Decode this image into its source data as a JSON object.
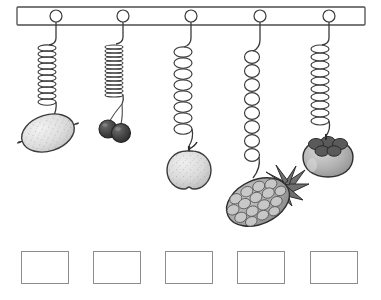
{
  "worksheet": {
    "title": "Springs with hanging fruits comparison worksheet",
    "background_color": "#ffffff",
    "width": 381,
    "height": 300
  },
  "support_bar": {
    "name": "horizontal-support-bar",
    "x": 17,
    "y": 7,
    "width": 348,
    "height": 18,
    "fill": "#ffffff",
    "stroke": "#4d4d4d",
    "stroke_width": 1.3
  },
  "hooks": [
    {
      "label": "hook-1",
      "cx": 56,
      "cy": 16,
      "r": 6
    },
    {
      "label": "hook-2",
      "cx": 123,
      "cy": 16,
      "r": 6
    },
    {
      "label": "hook-3",
      "cx": 191,
      "cy": 16,
      "r": 6
    },
    {
      "label": "hook-4",
      "cx": 260,
      "cy": 16,
      "r": 6
    },
    {
      "label": "hook-5",
      "cx": 329,
      "cy": 16,
      "r": 6
    }
  ],
  "springs": [
    {
      "id": "spring-1",
      "fruit": "lemon",
      "anchor_x": 56,
      "coil_top": 45,
      "coil_bottom": 104,
      "coils": 10,
      "coil_rx": 9,
      "coil_ry": 3.2,
      "stretch": "slightly-stretched",
      "hook_end_y": 118
    },
    {
      "id": "spring-2",
      "fruit": "cherries",
      "anchor_x": 123,
      "coil_top": 44,
      "coil_bottom": 95,
      "coils": 13,
      "coil_rx": 9,
      "coil_ry": 2.0,
      "stretch": "compressed",
      "hook_end_y": 104
    },
    {
      "id": "spring-3",
      "fruit": "apple",
      "anchor_x": 191,
      "coil_top": 46,
      "coil_bottom": 130,
      "coils": 8,
      "coil_rx": 9,
      "coil_ry": 5.2,
      "stretch": "stretched",
      "hook_end_y": 146
    },
    {
      "id": "spring-4",
      "fruit": "pineapple",
      "anchor_x": 260,
      "coil_top": 50,
      "coil_bottom": 162,
      "coils": 8,
      "coil_rx": 7.5,
      "coil_ry": 6.4,
      "stretch": "most-stretched",
      "hook_end_y": 180
    },
    {
      "id": "spring-5",
      "fruit": "persimmon",
      "anchor_x": 329,
      "coil_top": 45,
      "coil_bottom": 122,
      "coils": 10,
      "coil_rx": 9,
      "coil_ry": 4.0,
      "stretch": "moderately-stretched",
      "hook_end_y": 136
    }
  ],
  "fruits": [
    {
      "id": "fruit-lemon",
      "name": "lemon",
      "cx": 48,
      "cy": 133,
      "rx": 27,
      "ry": 18,
      "rotation": -18,
      "fill": "#e0e0e0",
      "stroke": "#3a3a3a",
      "texture": "speckled"
    },
    {
      "id": "fruit-cherries",
      "name": "cherries",
      "cx": 117,
      "cy": 127,
      "r": 9,
      "fill": "#4a4a4a",
      "stroke": "#232323",
      "count": 2
    },
    {
      "id": "fruit-apple",
      "name": "apple",
      "cx": 189,
      "cy": 165,
      "rx": 22,
      "ry": 21,
      "fill": "#dcdcdc",
      "stroke": "#3a3a3a",
      "texture": "speckled"
    },
    {
      "id": "fruit-pineapple",
      "name": "pineapple",
      "cx": 258,
      "cy": 202,
      "rx": 33,
      "ry": 22,
      "rotation": -24,
      "fill": "#b4b4b4",
      "stroke": "#2e2e2e",
      "texture": "diamond-scales",
      "crown": "spiky-leaves"
    },
    {
      "id": "fruit-persimmon",
      "name": "persimmon",
      "cx": 328,
      "cy": 159,
      "rx": 25,
      "ry": 19,
      "fill": "#b9b9b9",
      "stroke": "#2e2e2e",
      "calyx": "dark-star-cap"
    }
  ],
  "answer_boxes": [
    {
      "id": "answer-box-1",
      "x": 21,
      "y": 0,
      "value": ""
    },
    {
      "id": "answer-box-2",
      "x": 93,
      "y": 0,
      "value": ""
    },
    {
      "id": "answer-box-3",
      "x": 165,
      "y": 0,
      "value": ""
    },
    {
      "id": "answer-box-4",
      "x": 237,
      "y": 0,
      "value": ""
    },
    {
      "id": "answer-box-5",
      "x": 310,
      "y": 0,
      "value": ""
    }
  ],
  "colors": {
    "line": "#3a3a3a",
    "bar_stroke": "#4d4d4d",
    "box_border": "#8d8d8d",
    "lemon": "#e0e0e0",
    "cherry": "#4a4a4a",
    "apple": "#dcdcdc",
    "pineapple": "#b4b4b4",
    "persimmon": "#b9b9b9"
  }
}
